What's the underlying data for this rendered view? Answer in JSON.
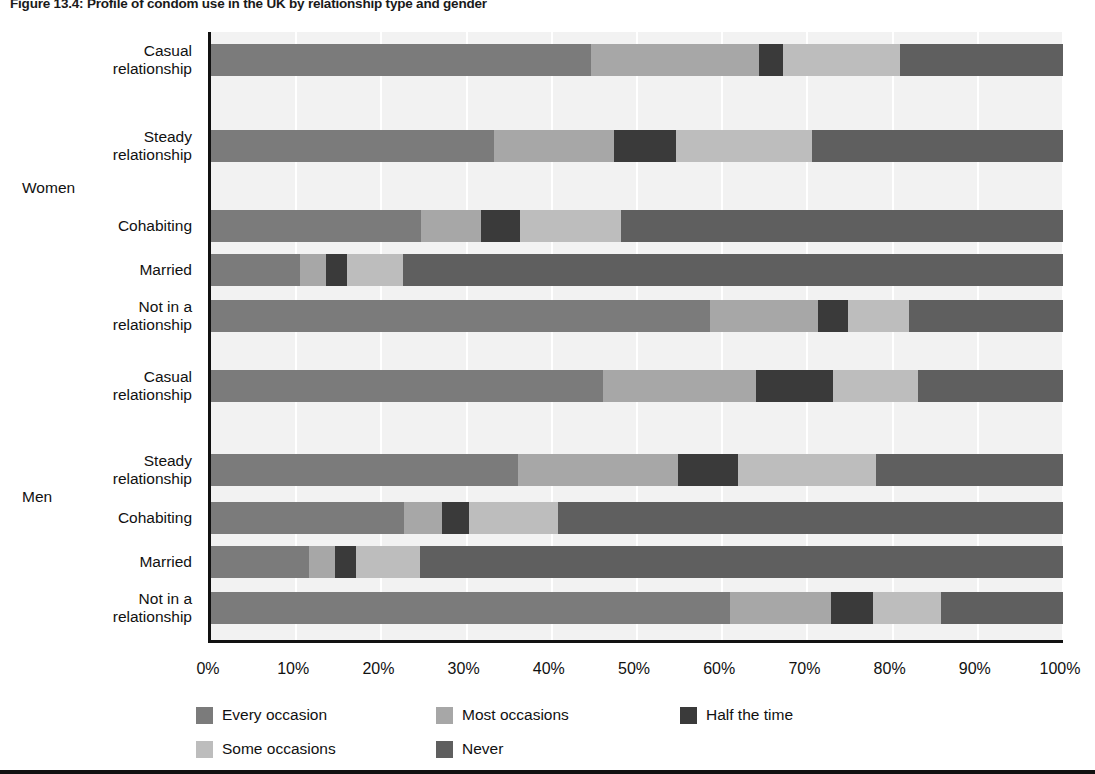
{
  "title": "Figure 13.4: Profile of condom use in the UK by relationship type and gender",
  "chart_data": {
    "type": "bar",
    "orientation": "horizontal",
    "stacked": true,
    "title": "Figure 13.4: Profile of condom use in the UK by relationship type and gender",
    "xlabel": "",
    "ylabel": "",
    "xlim": [
      0,
      100
    ],
    "xtick_labels": [
      "0%",
      "10%",
      "20%",
      "30%",
      "40%",
      "50%",
      "60%",
      "70%",
      "80%",
      "90%",
      "100%"
    ],
    "xticks": [
      0,
      10,
      20,
      30,
      40,
      50,
      60,
      70,
      80,
      90,
      100
    ],
    "grid": "vertical",
    "legend_position": "bottom",
    "legend": [
      "Every occasion",
      "Most occasions",
      "Half the time",
      "Some occasions",
      "Never"
    ],
    "series_colors": {
      "Every occasion": "#7b7b7b",
      "Most occasions": "#a7a7a7",
      "Half the time": "#3a3a3a",
      "Some occasions": "#bdbdbd",
      "Never": "#5f5f5f"
    },
    "groups": [
      {
        "name": "Women",
        "categories": [
          "Casual relationship",
          "Steady relationship",
          "Cohabiting",
          "Married",
          "Not in a relationship"
        ],
        "rows": [
          {
            "category": "Casual relationship",
            "values": [
              44.6,
              19.7,
              2.8,
              13.8,
              19.1
            ]
          },
          {
            "category": "Steady relationship",
            "values": [
              33.2,
              14.1,
              7.3,
              15.9,
              29.5
            ]
          },
          {
            "category": "Cohabiting",
            "values": [
              24.6,
              7.1,
              4.6,
              11.8,
              51.9
            ]
          },
          {
            "category": "Married",
            "values": [
              10.5,
              3.0,
              2.5,
              6.5,
              77.5
            ]
          },
          {
            "category": "Not in a relationship",
            "values": [
              58.6,
              12.6,
              3.6,
              7.1,
              18.1
            ]
          }
        ]
      },
      {
        "name": "Men",
        "categories": [
          "Casual relationship",
          "Steady relationship",
          "Cohabiting",
          "Married",
          "Not in a relationship"
        ],
        "rows": [
          {
            "category": "Casual relationship",
            "values": [
              46.0,
              18.0,
              9.0,
              10.0,
              17.0
            ]
          },
          {
            "category": "Steady relationship",
            "values": [
              36.0,
              18.8,
              7.1,
              16.1,
              22.0
            ]
          },
          {
            "category": "Cohabiting",
            "values": [
              22.6,
              4.5,
              3.2,
              10.4,
              59.3
            ]
          },
          {
            "category": "Married",
            "values": [
              11.5,
              3.0,
              2.5,
              7.5,
              75.5
            ]
          },
          {
            "category": "Not in a relationship",
            "values": [
              60.9,
              11.9,
              4.9,
              8.0,
              14.3
            ]
          }
        ]
      }
    ]
  },
  "axis": {
    "x_ticks": [
      {
        "label": "0%",
        "value": 0
      },
      {
        "label": "10%",
        "value": 10
      },
      {
        "label": "20%",
        "value": 20
      },
      {
        "label": "30%",
        "value": 30
      },
      {
        "label": "40%",
        "value": 40
      },
      {
        "label": "50%",
        "value": 50
      },
      {
        "label": "60%",
        "value": 60
      },
      {
        "label": "70%",
        "value": 70
      },
      {
        "label": "80%",
        "value": 80
      },
      {
        "label": "90%",
        "value": 90
      },
      {
        "label": "100%",
        "value": 100
      }
    ]
  },
  "y_labels": [
    "Casual relationship",
    "Steady relationship",
    "Cohabiting",
    "Married",
    "Not in a relationship",
    "Casual relationship",
    "Steady relationship",
    "Cohabiting",
    "Married",
    "Not in a relationship"
  ],
  "group_labels": {
    "women": "Women",
    "men": "Men"
  },
  "legend_items": [
    {
      "label": "Every occasion",
      "color": "#7b7b7b"
    },
    {
      "label": "Most occasions",
      "color": "#a7a7a7"
    },
    {
      "label": "Half the time",
      "color": "#3a3a3a"
    },
    {
      "label": "Some occasions",
      "color": "#bdbdbd"
    },
    {
      "label": "Never",
      "color": "#5f5f5f"
    }
  ]
}
